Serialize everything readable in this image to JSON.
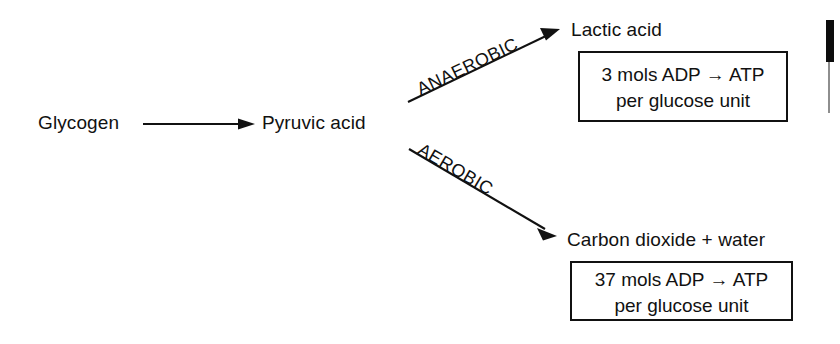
{
  "diagram": {
    "ink_color": "#111111",
    "background_color": "#ffffff",
    "nodes": [
      {
        "id": "glycogen",
        "label": "Glycogen"
      },
      {
        "id": "pyruvic-acid",
        "label": "Pyruvic acid"
      },
      {
        "id": "lactic-acid",
        "label": "Lactic acid"
      },
      {
        "id": "carbon-dioxide-water",
        "label": "Carbon dioxide + water"
      }
    ],
    "edges": [
      {
        "id": "glycogen-to-pyruvic",
        "label": "",
        "from": "glycogen",
        "to": "pyruvic-acid",
        "direction": "horizontal"
      },
      {
        "id": "anaerobic",
        "label": "ANAEROBIC",
        "from": "pyruvic-acid",
        "to": "lactic-acid",
        "direction": "up-right"
      },
      {
        "id": "aerobic",
        "label": "AEROBIC",
        "from": "pyruvic-acid",
        "to": "carbon-dioxide-water",
        "direction": "down-right"
      }
    ],
    "boxes": [
      {
        "id": "anaerobic-yield",
        "line1": "3 mols ADP → ATP",
        "line2": "per glucose unit"
      },
      {
        "id": "aerobic-yield",
        "line1": "37 mols ADP → ATP",
        "line2": "per glucose unit"
      }
    ],
    "artifacts": {
      "right_edge_bar_color": "#0d0d0d",
      "right_edge_line_color": "#8e8e8e"
    }
  }
}
